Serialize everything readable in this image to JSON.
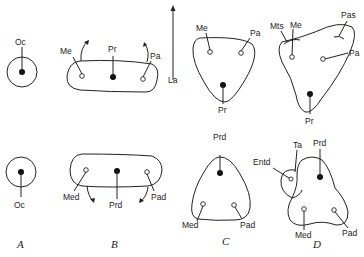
{
  "figure": {
    "orientation_axis": {
      "label": "La",
      "direction": "up-arrow"
    },
    "panels": [
      {
        "id": "A",
        "caption": "A",
        "upper": {
          "cusps": [
            {
              "label": "Oc",
              "type": "main"
            }
          ]
        },
        "lower": {
          "cusps": [
            {
              "label": "Oc",
              "type": "main"
            }
          ]
        }
      },
      {
        "id": "B",
        "caption": "B",
        "upper": {
          "cusps": [
            {
              "label": "Me",
              "type": "accessory"
            },
            {
              "label": "Pr",
              "type": "main"
            },
            {
              "label": "Pa",
              "type": "accessory"
            }
          ],
          "arrows": "up"
        },
        "lower": {
          "cusps": [
            {
              "label": "Med",
              "type": "accessory"
            },
            {
              "label": "Prd",
              "type": "main"
            },
            {
              "label": "Pad",
              "type": "accessory"
            }
          ],
          "arrows": "down"
        }
      },
      {
        "id": "C",
        "caption": "C",
        "upper": {
          "cusps": [
            {
              "label": "Me",
              "type": "accessory"
            },
            {
              "label": "Pa",
              "type": "accessory"
            },
            {
              "label": "Pr",
              "type": "main"
            }
          ]
        },
        "lower": {
          "cusps": [
            {
              "label": "Prd",
              "type": "main"
            },
            {
              "label": "Med",
              "type": "accessory"
            },
            {
              "label": "Pad",
              "type": "accessory"
            }
          ]
        }
      },
      {
        "id": "D",
        "caption": "D",
        "upper": {
          "cusps": [
            {
              "label": "Mts",
              "type": "stylar"
            },
            {
              "label": "Me",
              "type": "accessory"
            },
            {
              "label": "Pas",
              "type": "stylar"
            },
            {
              "label": "Pa",
              "type": "accessory"
            },
            {
              "label": "Pr",
              "type": "main"
            }
          ]
        },
        "lower": {
          "cusps": [
            {
              "label": "Entd",
              "type": "accessory"
            },
            {
              "label": "Ta",
              "type": "talonid"
            },
            {
              "label": "Prd",
              "type": "main"
            },
            {
              "label": "Med",
              "type": "accessory"
            },
            {
              "label": "Pad",
              "type": "accessory"
            }
          ]
        }
      }
    ]
  },
  "labels": {
    "La": "La",
    "A_up_Oc": "Oc",
    "A_lo_Oc": "Oc",
    "B_up_Me": "Me",
    "B_up_Pr": "Pr",
    "B_up_Pa": "Pa",
    "B_lo_Med": "Med",
    "B_lo_Prd": "Prd",
    "B_lo_Pad": "Pad",
    "C_up_Me": "Me",
    "C_up_Pa": "Pa",
    "C_up_Pr": "Pr",
    "C_lo_Prd": "Prd",
    "C_lo_Med": "Med",
    "C_lo_Pad": "Pad",
    "D_up_Mts": "Mts",
    "D_up_Me": "Me",
    "D_up_Pas": "Pas",
    "D_up_Pa": "Pa",
    "D_up_Pr": "Pr",
    "D_lo_Entd": "Entd",
    "D_lo_Ta": "Ta",
    "D_lo_Prd": "Prd",
    "D_lo_Med": "Med",
    "D_lo_Pad": "Pad"
  },
  "captions": {
    "A": "A",
    "B": "B",
    "C": "C",
    "D": "D"
  }
}
